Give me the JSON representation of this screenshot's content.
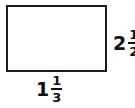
{
  "figure": {
    "shape_name": "rectangle",
    "stroke_color": "#1a1a1a",
    "fill_color": "#ffffff"
  },
  "background_color": "#ffffff",
  "text_color": "#111111",
  "labels": {
    "bottom": {
      "role": "width",
      "whole": "1",
      "numerator": "1",
      "denominator": "3",
      "full_text": "1 1/3"
    },
    "right": {
      "role": "height",
      "whole": "2",
      "numerator": "1",
      "denominator": "2",
      "full_text": "2 1/2",
      "note": "clipped at right edge of image"
    }
  }
}
